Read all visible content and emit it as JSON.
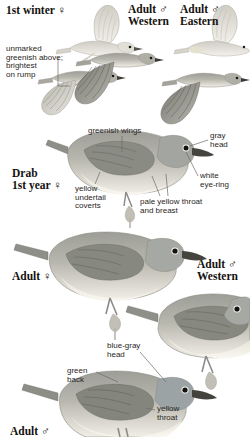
{
  "plate": {
    "title": "Warbling Vireo plate",
    "background_color": "#ffffff",
    "ink_color": "#15120f",
    "annotation_color": "#2a2623",
    "leader_color": "#6e6a66"
  },
  "palette": {
    "upper_gray_olive": "#9a9a93",
    "upper_dark": "#7c7d77",
    "wing_dark": "#6f7069",
    "head_gray": "#a3a5a1",
    "underpart_cream": "#ece7dc",
    "underpart_white": "#f6f3ec",
    "bill_dark": "#3c3a36",
    "eye_black": "#1a1816",
    "eyering_white": "#f7f5f0",
    "flight_pale": "#d8d6cd",
    "flight_mid": "#b2b2a9",
    "leg_gray": "#8e8c86",
    "branch_gray": "#b7b4ac"
  },
  "panels": {
    "flight": {
      "headings": [
        {
          "text": "1st winter ♀",
          "x": 6,
          "y": 4
        },
        {
          "text": "Adult ♂\nWestern",
          "x": 128,
          "y": 3
        },
        {
          "text": "Adult ♂\nEastern",
          "x": 180,
          "y": 3
        }
      ],
      "annotations": [
        {
          "text": "unmarked\ngreenish above;\nbrightest\non rump",
          "x": 6,
          "y": 45
        }
      ]
    },
    "drab_first_year": {
      "headings": [
        {
          "text": "Drab\n1st year ♀",
          "x": 12,
          "y": 167
        }
      ],
      "annotations": [
        {
          "text": "greenish wings",
          "x": 88,
          "y": 127
        },
        {
          "text": "gray\nhead",
          "x": 210,
          "y": 132
        },
        {
          "text": "yellow\nundertail\ncoverts",
          "x": 75,
          "y": 185
        },
        {
          "text": "white\neye-ring",
          "x": 200,
          "y": 172
        },
        {
          "text": "pale yellow throat\nand breast",
          "x": 140,
          "y": 198
        }
      ]
    },
    "adults_middle": {
      "headings": [
        {
          "text": "Adult ♀",
          "x": 12,
          "y": 270
        },
        {
          "text": "Adult ♂\nWestern",
          "x": 197,
          "y": 258
        }
      ]
    },
    "adult_male_bottom": {
      "headings": [
        {
          "text": "Adult ♂",
          "x": 10,
          "y": 425
        }
      ],
      "annotations": [
        {
          "text": "blue-gray\nhead",
          "x": 107,
          "y": 342
        },
        {
          "text": "green\nback",
          "x": 67,
          "y": 367
        },
        {
          "text": "yellow\nthroat",
          "x": 157,
          "y": 405
        }
      ]
    }
  }
}
